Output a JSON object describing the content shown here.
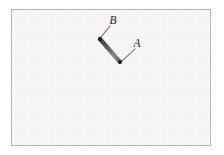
{
  "figure": {
    "canvas": {
      "width": 224,
      "height": 155,
      "background": "#ffffff"
    },
    "panel": {
      "name": "textured-panel",
      "x": 11,
      "y": 9,
      "width": 200,
      "height": 137,
      "border_color": "#b5b5b5",
      "fill_color": "#fcfcfc",
      "texture": {
        "style": "brick",
        "tile_width": 14,
        "tile_height": 7,
        "line_color": "#ededed",
        "block_color": "#f4f4f4"
      }
    },
    "rod": {
      "name": "rod-segment",
      "x1": 100,
      "y1": 39,
      "x2": 120,
      "y2": 62,
      "thickness": 4.2,
      "color_dark": "#4a4a4a",
      "color_light": "#8c8c8c"
    },
    "endpoints": [
      {
        "name": "rod-endpoint-upper",
        "x": 100,
        "y": 39,
        "radius": 1.9,
        "color": "#1a1a1a"
      },
      {
        "name": "rod-endpoint-lower",
        "x": 120,
        "y": 62,
        "radius": 1.9,
        "color": "#1a1a1a"
      }
    ],
    "labels": [
      {
        "name": "label-b",
        "text": "B",
        "x": 113,
        "y": 24,
        "leader": {
          "x1": 110,
          "y1": 26,
          "x2": 101,
          "y2": 37,
          "color": "#1a1a1a",
          "width": 0.8
        }
      },
      {
        "name": "label-a",
        "text": "A",
        "x": 137,
        "y": 47,
        "leader": {
          "x1": 135,
          "y1": 49,
          "x2": 122,
          "y2": 61,
          "color": "#1a1a1a",
          "width": 0.8
        }
      }
    ]
  }
}
